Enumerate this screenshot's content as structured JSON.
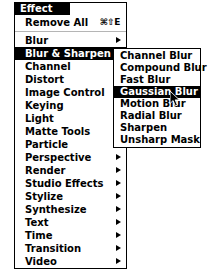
{
  "menu": {
    "title": "Effect",
    "top_command": {
      "label": "Remove All",
      "shortcut": "⌘⇧E"
    },
    "items": [
      {
        "label": "Blur",
        "submenu": true,
        "selected": false
      },
      {
        "label": "Blur & Sharpen",
        "submenu": true,
        "selected": true
      },
      {
        "label": "Channel",
        "submenu": true,
        "selected": false
      },
      {
        "label": "Distort",
        "submenu": true,
        "selected": false
      },
      {
        "label": "Image Control",
        "submenu": true,
        "selected": false
      },
      {
        "label": "Keying",
        "submenu": true,
        "selected": false
      },
      {
        "label": "Light",
        "submenu": true,
        "selected": false
      },
      {
        "label": "Matte Tools",
        "submenu": true,
        "selected": false
      },
      {
        "label": "Particle",
        "submenu": true,
        "selected": false
      },
      {
        "label": "Perspective",
        "submenu": true,
        "selected": false
      },
      {
        "label": "Render",
        "submenu": true,
        "selected": false
      },
      {
        "label": "Studio Effects",
        "submenu": true,
        "selected": false
      },
      {
        "label": "Stylize",
        "submenu": true,
        "selected": false
      },
      {
        "label": "Synthesize",
        "submenu": true,
        "selected": false
      },
      {
        "label": "Text",
        "submenu": true,
        "selected": false
      },
      {
        "label": "Time",
        "submenu": true,
        "selected": false
      },
      {
        "label": "Transition",
        "submenu": true,
        "selected": false
      },
      {
        "label": "Video",
        "submenu": true,
        "selected": false
      }
    ]
  },
  "submenu": {
    "parent": "Blur & Sharpen",
    "items": [
      {
        "label": "Channel Blur",
        "selected": false
      },
      {
        "label": "Compound Blur",
        "selected": false
      },
      {
        "label": "Fast Blur",
        "selected": false
      },
      {
        "label": "Gaussian Blur",
        "selected": true
      },
      {
        "label": "Motion Blur",
        "selected": false
      },
      {
        "label": "Radial Blur",
        "selected": false
      },
      {
        "label": "Sharpen",
        "selected": false
      },
      {
        "label": "Unsharp Mask",
        "selected": false
      }
    ]
  },
  "cursor": {
    "icon": "arrow-pointer",
    "x": 170,
    "y": 91
  },
  "colors": {
    "highlight_bg": "#000000",
    "highlight_fg": "#ffffff",
    "menu_bg": "#ffffff",
    "menu_border": "#000000",
    "separator": "#b5b5b5"
  }
}
